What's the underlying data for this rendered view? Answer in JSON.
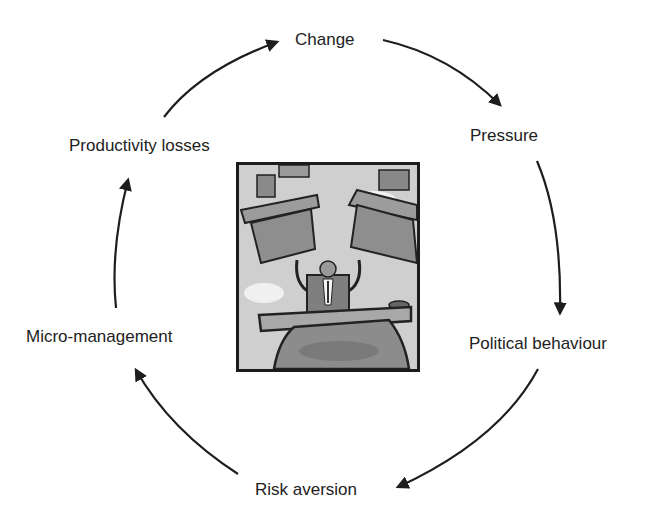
{
  "diagram": {
    "type": "cycle",
    "nodes": [
      {
        "id": "change",
        "label": "Change"
      },
      {
        "id": "pressure",
        "label": "Pressure"
      },
      {
        "id": "political",
        "label": "Political behaviour"
      },
      {
        "id": "risk",
        "label": "Risk aversion"
      },
      {
        "id": "micro",
        "label": "Micro-management"
      },
      {
        "id": "productivity",
        "label": "Productivity losses"
      }
    ],
    "edges": [
      {
        "from": "change",
        "to": "pressure"
      },
      {
        "from": "pressure",
        "to": "political"
      },
      {
        "from": "political",
        "to": "risk"
      },
      {
        "from": "risk",
        "to": "micro"
      },
      {
        "from": "micro",
        "to": "productivity"
      },
      {
        "from": "productivity",
        "to": "change"
      }
    ],
    "center_image": "cartoon-manager-juggling-desks"
  },
  "colors": {
    "arrow": "#1e1e1e",
    "text": "#222222",
    "frame": "#1c1c1c"
  }
}
